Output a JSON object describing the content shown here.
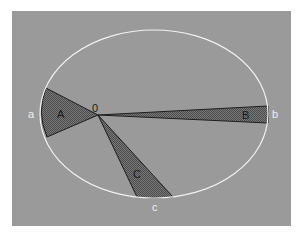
{
  "diagram": {
    "title": "",
    "colors": {
      "background": "#9a9a9a",
      "orbit": "#f2f2f2",
      "sector_fill": "#6e6e6e",
      "sector_edge": "#1e1e1e",
      "dark_label": "#1a1a1a",
      "light_label": "#f0f0f0"
    },
    "focus": {
      "label": "0"
    },
    "sectors": [
      {
        "id": "A",
        "label": "A"
      },
      {
        "id": "B",
        "label": "B"
      },
      {
        "id": "C",
        "label": "C"
      }
    ],
    "orbit_points": [
      {
        "id": "a",
        "label": "a"
      },
      {
        "id": "b",
        "label": "b"
      },
      {
        "id": "c",
        "label": "c"
      }
    ]
  }
}
